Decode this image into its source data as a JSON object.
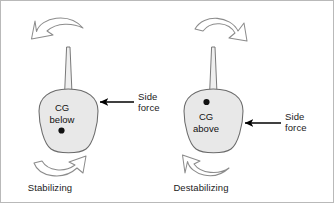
{
  "figure": {
    "type": "diagram",
    "background": "#ffffff",
    "border_color": "#b9b9b9"
  },
  "colors": {
    "body_fill": "#e8e8e8",
    "body_stroke": "#6b6b6b",
    "mast_fill": "#efefef",
    "mast_stroke": "#6b6b6b",
    "force_arrow": "#000000",
    "rotation_arrow_stroke": "#8c8c8c",
    "rotation_arrow_fill": "#ffffff",
    "cg_dot": "#111111",
    "text": "#1a1a1a"
  },
  "panels": [
    {
      "id": "left",
      "name": "cg-below-panel",
      "cg_line1": "CG",
      "cg_line2": "below",
      "cg_dot_position": "below-text",
      "force_label_line1": "Side",
      "force_label_line2": "force",
      "force_direction": "left",
      "top_rotation_direction": "counter-clockwise",
      "bottom_rotation_direction": "clockwise",
      "outcome_label": "Stabilizing"
    },
    {
      "id": "right",
      "name": "cg-above-panel",
      "cg_line1": "CG",
      "cg_line2": "above",
      "cg_dot_position": "above-text",
      "force_label_line1": "Side",
      "force_label_line2": "force",
      "force_direction": "left",
      "top_rotation_direction": "clockwise",
      "bottom_rotation_direction": "counter-clockwise",
      "outcome_label": "Destabilizing"
    }
  ]
}
